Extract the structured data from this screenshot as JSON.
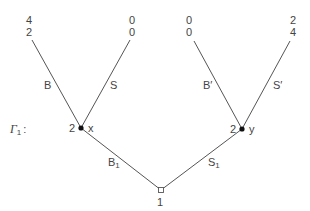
{
  "game": {
    "name": "Γ₁",
    "name_label": "Γ",
    "name_sub": "1",
    "name_colon": ":"
  },
  "nodes": {
    "root": {
      "player": "1",
      "x": 161,
      "y": 190
    },
    "x": {
      "player": "2",
      "label": "x",
      "x": 81,
      "y": 128
    },
    "y": {
      "player": "2",
      "label": "y",
      "x": 242,
      "y": 129
    }
  },
  "edges": {
    "B1": {
      "label": "B",
      "sub": "1"
    },
    "S1": {
      "label": "S",
      "sub": "1"
    },
    "B": {
      "label": "B"
    },
    "S": {
      "label": "S"
    },
    "Bp": {
      "label": "B′"
    },
    "Sp": {
      "label": "S′"
    }
  },
  "payoffs": {
    "BB": {
      "p1": "4",
      "p2": "2"
    },
    "BS": {
      "p1": "0",
      "p2": "0"
    },
    "SB": {
      "p1": "0",
      "p2": "0"
    },
    "SS": {
      "p1": "2",
      "p2": "4"
    }
  }
}
